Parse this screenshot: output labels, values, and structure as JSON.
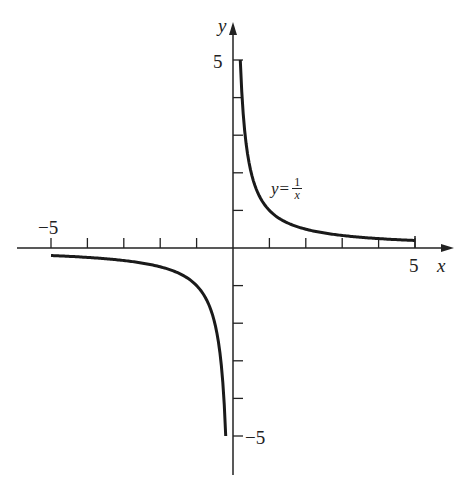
{
  "chart_data": {
    "type": "line",
    "title": "",
    "xlabel": "x",
    "ylabel": "y",
    "xlim": [
      -5,
      5
    ],
    "ylim": [
      -5,
      5
    ],
    "grid": false,
    "x_ticks": [
      -5,
      -4,
      -3,
      -2,
      -1,
      0,
      1,
      2,
      3,
      4,
      5
    ],
    "y_ticks": [
      -5,
      -4,
      -3,
      -2,
      -1,
      0,
      1,
      2,
      3,
      4,
      5
    ],
    "x_tick_labels": {
      "-5": "−5",
      "5": "5"
    },
    "y_tick_labels": {
      "5": "5",
      "-5": "−5"
    },
    "series": [
      {
        "name": "y = 1/x (x > 0)",
        "x": [
          0.2,
          0.25,
          0.333,
          0.5,
          1,
          1.5,
          2,
          2.5,
          3,
          3.5,
          4,
          4.5,
          5
        ],
        "values": [
          5,
          4,
          3,
          2,
          1,
          0.667,
          0.5,
          0.4,
          0.333,
          0.286,
          0.25,
          0.222,
          0.2
        ]
      },
      {
        "name": "y = 1/x (x < 0)",
        "x": [
          -5,
          -4.5,
          -4,
          -3.5,
          -3,
          -2.5,
          -2,
          -1.5,
          -1,
          -0.5,
          -0.333,
          -0.25,
          -0.2
        ],
        "values": [
          -0.2,
          -0.222,
          -0.25,
          -0.286,
          -0.333,
          -0.4,
          -0.5,
          -0.667,
          -1,
          -2,
          -3,
          -4,
          -5
        ]
      }
    ],
    "annotations": [
      {
        "text": "y = 1/x",
        "x": 1.3,
        "y": 1.6
      }
    ]
  },
  "labels": {
    "x_axis": "x",
    "y_axis": "y",
    "x_min": "−5",
    "x_max": "5",
    "y_max": "5",
    "y_min": "−5",
    "curve_lhs": "y",
    "curve_eq": "=",
    "curve_num": "1",
    "curve_den": "x"
  }
}
